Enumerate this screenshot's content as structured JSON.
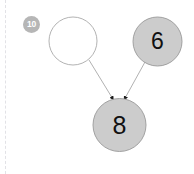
{
  "diagram": {
    "type": "directed-graph",
    "background_color": "#ffffff",
    "node_fill_filled": "#cccccc",
    "node_fill_empty": "#ffffff",
    "node_stroke": "#999999",
    "edge_color": "#a8a8a8",
    "label_color": "#111111",
    "badge": {
      "label": "10",
      "fill_color": "#b6b6b6",
      "text_color": "#ffffff"
    },
    "nodes": [
      {
        "id": "a",
        "label": "",
        "filled": false,
        "cx": 73,
        "cy": 41,
        "r": 24
      },
      {
        "id": "b",
        "label": "6",
        "filled": true,
        "cx": 157.5,
        "cy": 41.5,
        "r": 24.5
      },
      {
        "id": "c",
        "label": "8",
        "filled": true,
        "cx": 119.5,
        "cy": 125,
        "r": 26.5
      }
    ],
    "edges": [
      {
        "from": "a",
        "to": "c",
        "directed": true,
        "arrow": "filled-triangle"
      },
      {
        "from": "b",
        "to": "c",
        "directed": true,
        "arrow": "filled-triangle"
      }
    ],
    "rule": {
      "orientation": "vertical",
      "style": "dashed",
      "color": "#e2e2e6"
    }
  }
}
